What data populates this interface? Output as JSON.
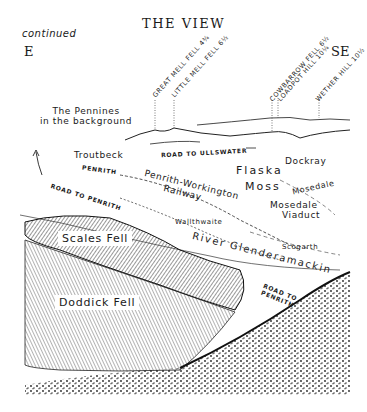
{
  "header": {
    "title": "THE VIEW",
    "subtitle": "continued",
    "direction_left": "E",
    "direction_right": "SE"
  },
  "peaks": [
    {
      "name": "GREAT MELL FELL",
      "distance": "4¾"
    },
    {
      "name": "LITTLE MELL FELL",
      "distance": "6½"
    },
    {
      "name": "COWBARROW FELL",
      "distance": "6½"
    },
    {
      "name": "LOADPOT HILL",
      "distance": "10¼"
    },
    {
      "name": "WETHER HILL",
      "distance": "10½"
    }
  ],
  "labels": {
    "pennines_line1": "The Pennines",
    "pennines_line2": "in the background",
    "troutbeck": "Troutbeck",
    "road_ullswater": "ROAD TO ULLSWATER",
    "dockray": "Dockray",
    "flaska": "Flaska",
    "moss": "Moss",
    "penrith": "PENRITH",
    "railway_line1": "Penrith-Workington",
    "railway_line2": "Railway",
    "road_penrith_left": "ROAD TO PENRITH",
    "mosedale": "Mosedale",
    "mosedale_viaduct_line1": "Mosedale",
    "mosedale_viaduct_line2": "Viaduct",
    "wallthwaite": "Wallthwaite",
    "scogarth": "Scogarth",
    "river": "River Glenderamackin",
    "road_penrith_right_line1": "ROAD TO",
    "road_penrith_right_line2": "PENRITH",
    "scales_fell": "Scales Fell",
    "doddick_fell": "Doddick Fell"
  },
  "colors": {
    "ink": "#1a1a1a",
    "paper": "#ffffff",
    "hatch": "#555555"
  }
}
